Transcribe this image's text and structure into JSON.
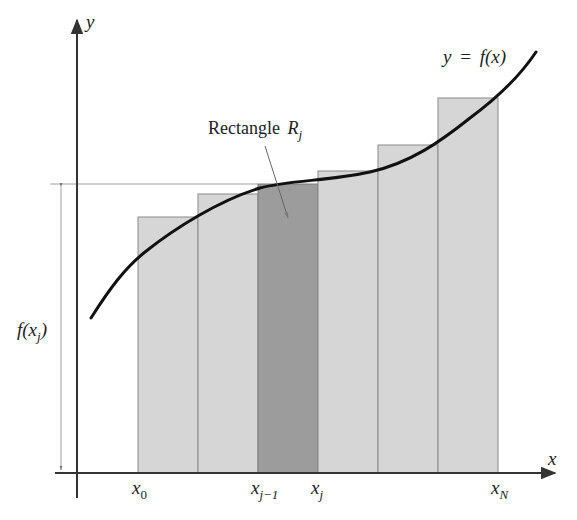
{
  "diagram": {
    "type": "riemann-sum-rectangles",
    "colors": {
      "axis": "#333333",
      "rect_fill": "#d6d6d6",
      "rect_highlight_fill": "#9c9c9c",
      "rect_stroke": "#8a8a8a",
      "curve": "#111111",
      "guide": "#888888"
    },
    "axes": {
      "x_label": "x",
      "y_label": "y"
    },
    "curve_label": {
      "lhs": "y",
      "eq": "=",
      "rhs": "f(x)"
    },
    "highlight_label": {
      "text": "Rectangle",
      "symbol": "R",
      "subscript": "j"
    },
    "height_label": {
      "prefix": "f(x",
      "subscript": "j",
      "suffix": ")"
    },
    "tick_labels": [
      {
        "base": "x",
        "sub": "0"
      },
      {
        "base": "x",
        "sub": "j−1"
      },
      {
        "base": "x",
        "sub": "j"
      },
      {
        "base": "x",
        "sub": "N"
      }
    ],
    "rectangles": [
      {
        "x": 138,
        "top": 217,
        "highlight": false
      },
      {
        "x": 198,
        "top": 194,
        "highlight": false
      },
      {
        "x": 258,
        "top": 184,
        "highlight": true
      },
      {
        "x": 318,
        "top": 171,
        "highlight": false
      },
      {
        "x": 378,
        "top": 145,
        "highlight": false
      },
      {
        "x": 438,
        "top": 98,
        "highlight": false
      }
    ]
  }
}
